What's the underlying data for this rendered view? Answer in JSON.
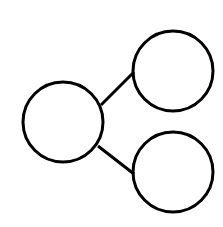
{
  "diagram": {
    "type": "tree",
    "stroke_color": "#000000",
    "background": "#ffffff",
    "nodes": [
      {
        "id": "root",
        "cx": 63,
        "cy": 122,
        "r": 40,
        "label": ""
      },
      {
        "id": "child-top",
        "cx": 173,
        "cy": 71,
        "r": 40,
        "label": ""
      },
      {
        "id": "child-bottom",
        "cx": 173,
        "cy": 172,
        "r": 40,
        "label": ""
      }
    ],
    "edges": [
      {
        "from": "root",
        "to": "child-top",
        "x1": 101,
        "y1": 105,
        "x2": 134,
        "y2": 72
      },
      {
        "from": "root",
        "to": "child-bottom",
        "x1": 98,
        "y1": 146,
        "x2": 134,
        "y2": 174
      }
    ]
  }
}
